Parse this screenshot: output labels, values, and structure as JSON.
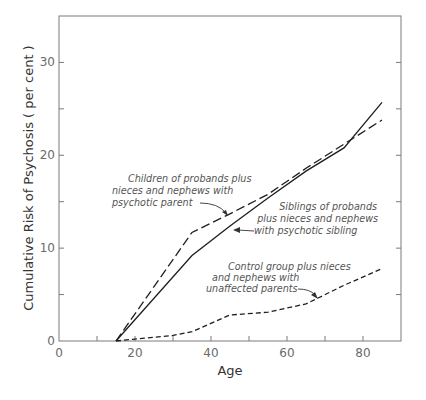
{
  "chart_data": {
    "type": "line",
    "title": "",
    "xlabel": "Age",
    "ylabel": "Cumulative Risk of Psychosis ( per cent )",
    "xlim": [
      0,
      90
    ],
    "ylim": [
      0,
      35
    ],
    "x_ticks": [
      0,
      10,
      20,
      30,
      40,
      50,
      60,
      70,
      80
    ],
    "x_tick_labels": [
      "0",
      "20",
      "40",
      "60",
      "80"
    ],
    "y_ticks": [
      0,
      5,
      10,
      15,
      20,
      25,
      30
    ],
    "y_tick_labels": [
      "0",
      "10",
      "20",
      "30"
    ],
    "grid": false,
    "legend": "inline annotations with arrows",
    "series": [
      {
        "name": "Children of probands plus nieces and nephews with psychotic parent",
        "style": "long-dash",
        "x": [
          15,
          35,
          45,
          55,
          65,
          75,
          85
        ],
        "values": [
          0,
          11.7,
          13.7,
          15.8,
          18.6,
          21.2,
          23.8
        ]
      },
      {
        "name": "Siblings of probands plus nieces and nephews with psychotic sibling",
        "style": "solid",
        "x": [
          15,
          35,
          45,
          55,
          65,
          75,
          85
        ],
        "values": [
          0,
          9.2,
          12.4,
          15.4,
          18.3,
          20.8,
          25.7
        ]
      },
      {
        "name": "Control group plus nieces and nephews with unaffected parents",
        "style": "short-dash",
        "x": [
          15,
          20,
          30,
          35,
          45,
          55,
          65,
          75,
          85
        ],
        "values": [
          0,
          0.2,
          0.6,
          1.0,
          2.8,
          3.1,
          4.0,
          6.0,
          7.8
        ]
      }
    ],
    "annotations": [
      {
        "series": 0,
        "lines": [
          "Children of probands plus",
          "nieces and nephews with",
          "psychotic parent"
        ]
      },
      {
        "series": 1,
        "lines": [
          "Siblings of probands",
          "plus nieces and nephews",
          "with psychotic sibling"
        ]
      },
      {
        "series": 2,
        "lines": [
          "Control group plus nieces",
          "and nephews with",
          "unaffected parents"
        ]
      }
    ],
    "colors": {
      "lines": "#1e1e1e",
      "axes": "#7a7a7a",
      "text": "#555555"
    }
  }
}
